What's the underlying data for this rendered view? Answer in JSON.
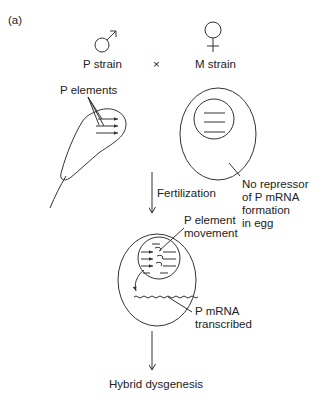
{
  "panel_label": "(a)",
  "cross": {
    "male": {
      "symbol": "male-symbol",
      "label": "P strain"
    },
    "operator": "×",
    "female": {
      "symbol": "female-symbol",
      "label": "M strain"
    }
  },
  "sperm": {
    "annotation": "P elements"
  },
  "egg": {
    "annotation": "No repressor\nof P mRNA\nformation\nin egg"
  },
  "steps": {
    "fertilization": "Fertilization",
    "zygote_annotations": {
      "movement": "P element\nmovement",
      "mrna": "P mRNA\ntranscribed"
    },
    "outcome": "Hybrid dysgenesis"
  },
  "colors": {
    "line": "#333333",
    "background": "#ffffff"
  }
}
